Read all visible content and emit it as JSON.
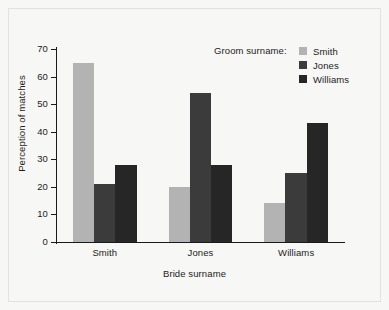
{
  "chart_data": {
    "type": "bar",
    "title": "",
    "subtitle": "",
    "xlabel": "Bride surname",
    "ylabel": "Perception of matches",
    "categories": [
      "Smith",
      "Jones",
      "Williams"
    ],
    "series": [
      {
        "name": "Smith",
        "values": [
          65,
          20,
          14
        ],
        "color": "#b3b3b3"
      },
      {
        "name": "Jones",
        "values": [
          21,
          54,
          25
        ],
        "color": "#3b3b3b"
      },
      {
        "name": "Williams",
        "values": [
          28,
          28,
          43
        ],
        "color": "#262626"
      }
    ],
    "ylim": [
      0,
      70
    ],
    "yticks": [
      0,
      10,
      20,
      30,
      40,
      50,
      60,
      70
    ],
    "ytick_labels": [
      "0",
      "10",
      "20",
      "30",
      "40",
      "50",
      "60",
      "70"
    ],
    "grid": false,
    "legend_position": "top-right",
    "legend_title": "Groom surname:",
    "grouping": "grouped",
    "bar_gap_within_group": 0
  },
  "legend": {
    "title": "Groom surname:",
    "entries": [
      {
        "label": "Smith",
        "color": "#b3b3b3"
      },
      {
        "label": "Jones",
        "color": "#3b3b3b"
      },
      {
        "label": "Williams",
        "color": "#262626"
      }
    ]
  },
  "axes": {
    "y_title": "Perception of matches",
    "x_title": "Bride surname",
    "y_ticks": [
      "0",
      "10",
      "20",
      "30",
      "40",
      "50",
      "60",
      "70"
    ],
    "x_groups": [
      "Smith",
      "Jones",
      "Williams"
    ]
  },
  "colors": {
    "background": "#f7f7f5",
    "axis": "#1a1a1a",
    "text": "#1c1c1c",
    "series_smith": "#b3b3b3",
    "series_jones": "#3b3b3b",
    "series_williams": "#262626"
  }
}
